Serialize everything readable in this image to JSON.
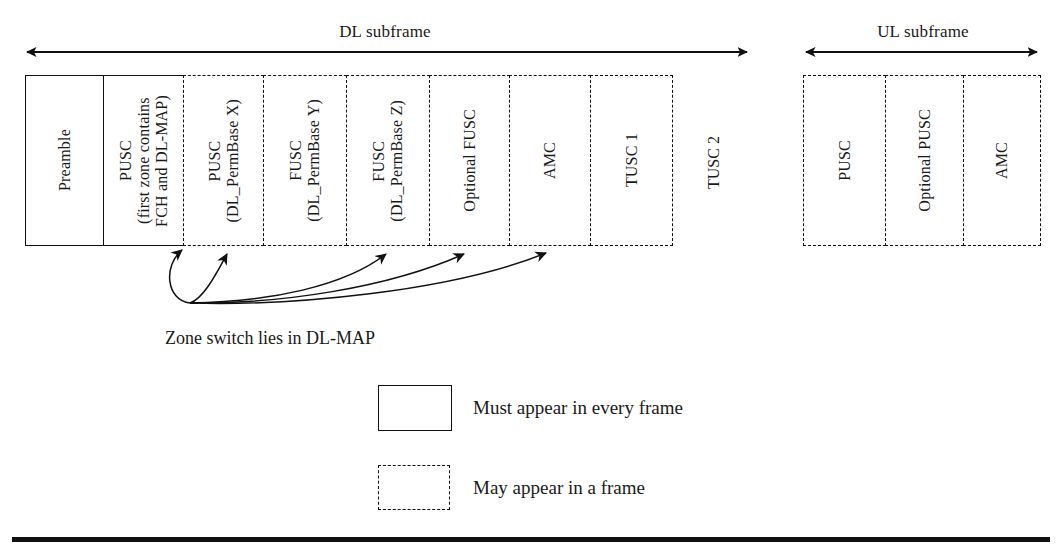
{
  "figure": {
    "dl": {
      "span_label": "DL subframe",
      "zones": [
        {
          "label": "Preamble",
          "style": "solid"
        },
        {
          "label": "PUSC\n(first zone contains\nFCH and DL-MAP)",
          "style": "solid"
        },
        {
          "label": "PUSC\n(DL_PermBase X)",
          "style": "dashed"
        },
        {
          "label": "FUSC\n(DL_PermBase Y)",
          "style": "dashed"
        },
        {
          "label": "FUSC\n(DL_PermBase Z)",
          "style": "dashed"
        },
        {
          "label": "Optional FUSC",
          "style": "dashed"
        },
        {
          "label": "AMC",
          "style": "dashed"
        },
        {
          "label": "TUSC 1",
          "style": "dashed"
        }
      ],
      "trailing_label": "TUSC 2"
    },
    "ul": {
      "span_label": "UL subframe",
      "zones": [
        {
          "label": "PUSC",
          "style": "dashed"
        },
        {
          "label": "Optional PUSC",
          "style": "dashed"
        },
        {
          "label": "AMC",
          "style": "dashed"
        }
      ]
    },
    "note": "Zone switch lies in DL-MAP",
    "legend": [
      {
        "style": "solid",
        "text": "Must appear in every frame"
      },
      {
        "style": "dashed",
        "text": "May appear in a frame"
      }
    ]
  },
  "colors": {
    "ink": "#111111",
    "paper": "#ffffff"
  }
}
